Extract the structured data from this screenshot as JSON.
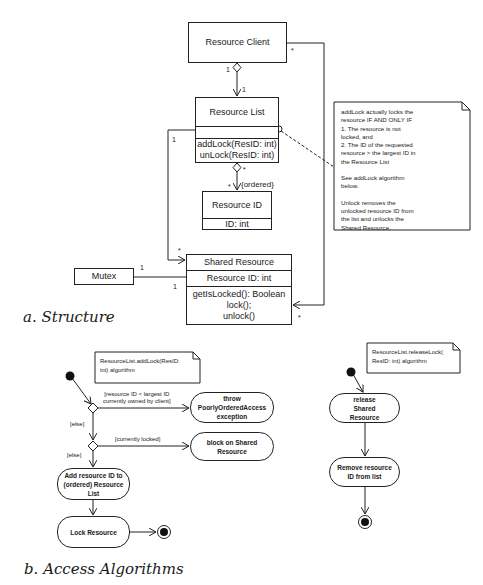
{
  "structure": {
    "caption": "a. Structure",
    "classes": {
      "resource_client": {
        "name": "Resource Client"
      },
      "resource_list": {
        "name": "Resource List",
        "methods": [
          "addLock(ResID: int)",
          "unLock(ResID: int)"
        ]
      },
      "resource_id": {
        "name": "Resource ID",
        "attributes": [
          "ID: int"
        ]
      },
      "shared_resource": {
        "name": "Shared Resource",
        "attributes": [
          "Resource ID: int"
        ],
        "methods": [
          "getIsLocked(): Boolean",
          "lock();",
          "unlock()"
        ]
      },
      "mutex": {
        "name": "Mutex"
      }
    },
    "multiplicities": {
      "client_list_client": "1",
      "client_list_list": "1",
      "list_id_list": "*",
      "list_id_id": "*",
      "list_id_constraint": "{ordered}",
      "list_shared_list": "1",
      "list_shared_shared": "*",
      "client_shared_client": "*",
      "client_shared_shared": "*",
      "mutex_shared_mutex": "1",
      "mutex_shared_shared": "1"
    },
    "note": {
      "lines": [
        "addLock actually locks the",
        "resource IF AND ONLY IF",
        "1. The resource is not",
        "locked, and",
        "2. The ID of the requested",
        "resource > the largest ID in",
        "the Resource List",
        "",
        "See addLock algorithm",
        "below.",
        "",
        "Unlock removes the",
        "unlocked resource ID from",
        "the list and unlocks the",
        "Shared Resource."
      ]
    }
  },
  "algorithms": {
    "caption": "b. Access Algorithms",
    "add_lock": {
      "note": [
        "ResourceList.addLock(ResID:",
        "int) algorithm"
      ],
      "guard_1": [
        "[resource ID < largest ID",
        "currently owned by client]"
      ],
      "guard_2": "[currently locked]",
      "else_1": "[else]",
      "else_2": "[else]",
      "action_throw": "throw PoorlyOrderedAccess exception",
      "action_block": "block on Shared Resource",
      "action_add": "Add resource ID to (ordered) Resource List",
      "action_lock": "Lock Resource"
    },
    "release_lock": {
      "note": [
        "ResourceList.releaseLock(",
        "ResID: int) algorithm"
      ],
      "action_release": "release Shared Resource",
      "action_remove": "Remove resource ID from list"
    }
  }
}
